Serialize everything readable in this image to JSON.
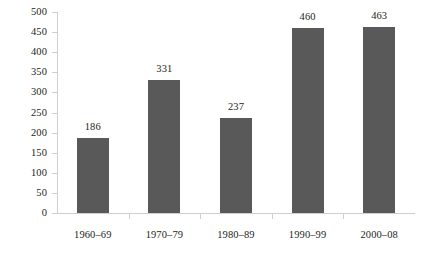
{
  "chart_data": {
    "type": "bar",
    "title": "",
    "subtitle": "",
    "xlabel": "",
    "ylabel": "",
    "categories": [
      "1960–69",
      "1970–79",
      "1980–89",
      "1990–99",
      "2000–08"
    ],
    "values": [
      186,
      331,
      237,
      460,
      463
    ],
    "data_labels": [
      "186",
      "331",
      "237",
      "460",
      "463"
    ],
    "ylim": [
      0,
      500
    ],
    "ytick_values": [
      0,
      50,
      100,
      150,
      200,
      250,
      300,
      350,
      400,
      450,
      500
    ],
    "ytick_labels": [
      "0",
      "50",
      "100",
      "150",
      "200",
      "250",
      "300",
      "350",
      "400",
      "450",
      "500"
    ],
    "grid": false,
    "legend": null,
    "legend_position": "none",
    "series": [
      {
        "name": "",
        "values": [
          186,
          331,
          237,
          460,
          463
        ]
      }
    ],
    "colors": {
      "bar_fill": "#595959",
      "axis_line": "#cfcfcf",
      "text": "#231f20",
      "background": "#ffffff"
    }
  }
}
